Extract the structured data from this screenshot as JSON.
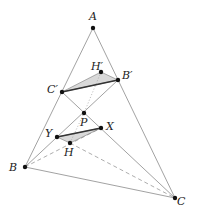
{
  "diagram": {
    "points": {
      "A": {
        "label": "A",
        "x": 93,
        "y": 28,
        "lx": 89,
        "ly": 11
      },
      "B": {
        "label": "B",
        "x": 25,
        "y": 167,
        "lx": 9,
        "ly": 162
      },
      "C": {
        "label": "C",
        "x": 175,
        "y": 198,
        "lx": 177,
        "ly": 196
      },
      "B1": {
        "label": "B′",
        "x": 118,
        "y": 80,
        "lx": 122,
        "ly": 70
      },
      "C1": {
        "label": "C′",
        "x": 62,
        "y": 92,
        "lx": 47,
        "ly": 84
      },
      "H1": {
        "label": "H′",
        "x": 101,
        "y": 72,
        "lx": 91,
        "ly": 61
      },
      "P": {
        "label": "P",
        "x": 84,
        "y": 113,
        "lx": 80,
        "ly": 117
      },
      "X": {
        "label": "X",
        "x": 101,
        "y": 128,
        "lx": 106,
        "ly": 121
      },
      "Y": {
        "label": "Y",
        "x": 57,
        "y": 137,
        "lx": 45,
        "ly": 128
      },
      "H": {
        "label": "H",
        "x": 70,
        "y": 143,
        "lx": 64,
        "ly": 147
      }
    },
    "colors": {
      "line": "#8a8a8a",
      "thick": "#333333",
      "fill": "#d9d9d9",
      "point": "#111111"
    }
  }
}
